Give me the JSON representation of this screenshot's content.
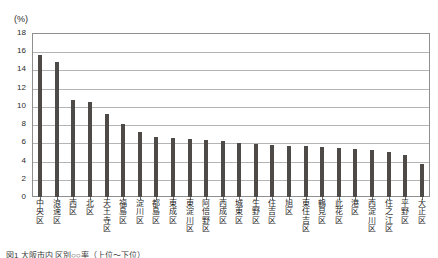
{
  "unit_label": "(%)",
  "caption": "図1 大阪市内 区別○○率（上位～下位）",
  "axis": {
    "y_ticks": [
      "0",
      "2",
      "4",
      "6",
      "8",
      "10",
      "12",
      "14",
      "16",
      "18"
    ],
    "y_min": 0,
    "y_max": 18,
    "y_step": 2
  },
  "colors": {
    "bar": "#4d4a48",
    "gridline": "#b4b4b4",
    "frame": "#8f8f8f",
    "text": "#1f1f1f",
    "background": "#ffffff"
  },
  "chart_data": {
    "type": "bar",
    "title": "",
    "subtitle": "",
    "xlabel": "",
    "ylabel": "(%)",
    "ylim": [
      0,
      18
    ],
    "ytick_step": 2,
    "grid": true,
    "legend": "none",
    "orientation": "vertical",
    "sorted": "descending",
    "categories": [
      "中央区",
      "浪速区",
      "西区",
      "北区",
      "天王寺区",
      "福島区",
      "淀川区",
      "都島区",
      "東成区",
      "東淀川区",
      "阿倍野区",
      "西成区",
      "城東区",
      "生野区",
      "住吉区",
      "旭区",
      "東住吉区",
      "鶴見区",
      "此花区",
      "港区",
      "西淀川区",
      "住之江区",
      "平野区",
      "大正区"
    ],
    "values": [
      15.6,
      14.8,
      10.6,
      10.4,
      9.1,
      8.0,
      7.1,
      6.6,
      6.5,
      6.4,
      6.3,
      6.2,
      5.9,
      5.8,
      5.7,
      5.6,
      5.6,
      5.5,
      5.4,
      5.3,
      5.2,
      4.9,
      4.6,
      3.6
    ]
  }
}
